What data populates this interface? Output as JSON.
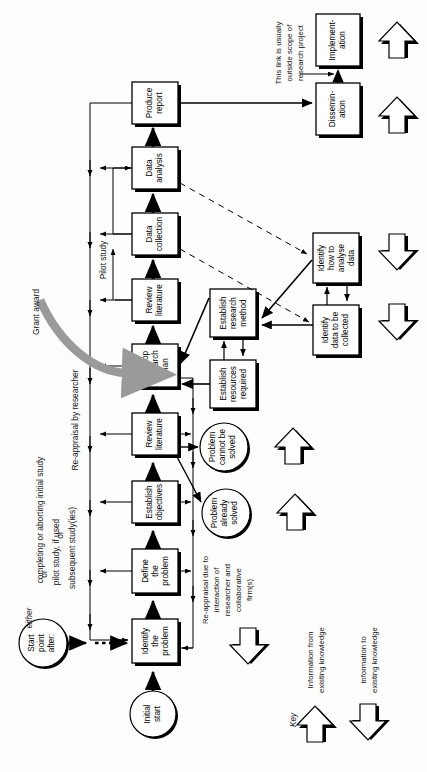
{
  "diagram": {
    "orientation": "rotated-90-counterclockwise",
    "colors": {
      "ink": "#000000",
      "paper": "#fdfdfd",
      "shadow": "#000000",
      "grant_arrow": "#9a9a9a"
    },
    "main_chain": [
      {
        "id": "initial-start",
        "shape": "circle",
        "label": "Initial\nstart",
        "lines": [
          "Initial",
          "start"
        ]
      },
      {
        "id": "identify-the-problem",
        "shape": "box",
        "lines": [
          "Identify",
          "the",
          "problem"
        ]
      },
      {
        "id": "define-the-problem",
        "shape": "box",
        "lines": [
          "Define",
          "the",
          "problem"
        ]
      },
      {
        "id": "establish-objectives",
        "shape": "box",
        "lines": [
          "Establish",
          "objectives"
        ]
      },
      {
        "id": "review-literature-1",
        "shape": "box",
        "lines": [
          "Review",
          "literature"
        ]
      },
      {
        "id": "develop-research-plan",
        "shape": "box",
        "lines": [
          "Develop",
          "research",
          "plan"
        ]
      },
      {
        "id": "review-literature-2",
        "shape": "box",
        "lines": [
          "Review",
          "literature"
        ]
      },
      {
        "id": "data-collection",
        "shape": "box",
        "lines": [
          "Data",
          "collection"
        ]
      },
      {
        "id": "data-analysis",
        "shape": "box",
        "lines": [
          "Data",
          "analysis"
        ]
      },
      {
        "id": "produce-report",
        "shape": "box",
        "lines": [
          "Produce",
          "report"
        ]
      }
    ],
    "side_boxes": [
      {
        "id": "establish-research-method",
        "lines": [
          "Establish",
          "research",
          "method"
        ]
      },
      {
        "id": "establish-resources-required",
        "lines": [
          "Establish",
          "resources",
          "required"
        ]
      },
      {
        "id": "identify-how-to-analyse-data",
        "lines": [
          "Identify",
          "how to",
          "analyse",
          "data"
        ]
      },
      {
        "id": "identify-data-to-be-collected",
        "lines": [
          "Identify",
          "data to be",
          "collected"
        ]
      },
      {
        "id": "dissemination",
        "lines": [
          "Dissemin-",
          "ation"
        ]
      },
      {
        "id": "implementation",
        "lines": [
          "Implement-",
          "ation"
        ]
      }
    ],
    "terminators": [
      {
        "id": "problem-cannot-be-solved",
        "lines": [
          "Problem",
          "cannot be",
          "solved"
        ]
      },
      {
        "id": "problem-already-solved",
        "lines": [
          "Problem",
          "already",
          "solved"
        ]
      },
      {
        "id": "start-point-after",
        "lines": [
          "Start",
          "point",
          "after:"
        ]
      }
    ],
    "annotations": {
      "start_point_either": "either",
      "start_point_or_1": "or",
      "start_point_or_2": "or",
      "start_point_option_1": "completing or aborting initial study",
      "start_point_option_2": "pilot study, if used",
      "start_point_option_3": "subsequent study(ies)",
      "reappraisal_by_researcher": "Re-appraisal by researcher",
      "reappraisal_interaction": [
        "Re-appraisal due to",
        "interaction of",
        "researcher and",
        "collaborative",
        "firm(s)"
      ],
      "pilot_study": "Pilot study",
      "grant_award": "Grant award",
      "outside_scope": [
        "This link is usually",
        "outside scope of",
        "research project"
      ]
    },
    "key": {
      "title": "Key",
      "entries": [
        {
          "id": "info-from-existing-knowledge",
          "label": [
            "Information from",
            "existing knowledge"
          ],
          "direction": "from"
        },
        {
          "id": "info-to-existing-knowledge",
          "label": [
            "Information to",
            "existing knowledge"
          ],
          "direction": "to"
        }
      ]
    }
  }
}
